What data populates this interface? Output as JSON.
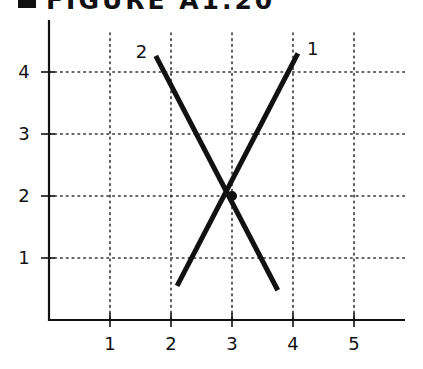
{
  "figure": {
    "title": "FIGURE A1.20"
  },
  "chart_data": {
    "type": "line",
    "title": "FIGURE A1.20",
    "xlabel": "",
    "ylabel": "",
    "xlim": [
      0,
      5.9
    ],
    "ylim": [
      0,
      4.9
    ],
    "x_ticks": [
      1,
      2,
      3,
      4,
      5
    ],
    "x_tick_labels": [
      "1",
      "2",
      "3",
      "4",
      "5"
    ],
    "y_ticks": [
      1,
      2,
      3,
      4
    ],
    "y_tick_labels": [
      "1",
      "2",
      "3",
      "4"
    ],
    "grid": "dotted",
    "legend": "none (series labeled at line ends)",
    "series": [
      {
        "name": "1",
        "points": [
          [
            2.1,
            0.55
          ],
          [
            4.08,
            4.3
          ]
        ]
      },
      {
        "name": "2",
        "points": [
          [
            1.75,
            4.26
          ],
          [
            3.75,
            0.48
          ]
        ]
      }
    ],
    "annotations": [
      {
        "type": "point",
        "x": 3,
        "y": 2,
        "label": "intersection"
      }
    ]
  }
}
